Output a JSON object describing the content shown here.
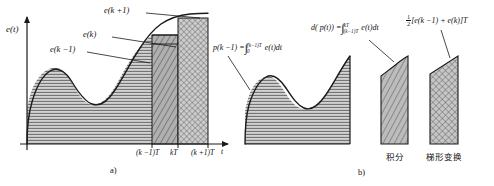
{
  "figure": {
    "caption_a": "a)",
    "caption_b": "b)"
  },
  "panel_a": {
    "y_axis_label": "e(t)",
    "x_axis_label": "t",
    "callouts": {
      "e_k_plus_1": "e(k +1)",
      "e_k": "e(k)",
      "e_k_minus_1": "e(k −1)"
    },
    "x_ticks": [
      "(k −1)T",
      "kT",
      "(k +1)T"
    ]
  },
  "panel_b": {
    "formula_p": {
      "lhs": "p(k −1) =",
      "upper_limit": "(k−1)T",
      "lower_limit": "0",
      "integrand": "e(t)dt"
    },
    "formula_dp": {
      "lhs": "d( p(t)) =",
      "upper_limit": "kT",
      "lower_limit": "(k−1)T",
      "integrand": "e(t)dt"
    },
    "formula_trap": {
      "numerator": "1",
      "denominator": "2",
      "body": "[e(k −1) + e(k)]T"
    },
    "bar_labels": {
      "integral": "积分",
      "trapezoid": "梯形变换"
    }
  },
  "colors": {
    "stroke": "#1a1a1a",
    "fill_light": "#d9d9d9",
    "fill_mid": "#c2c2c2",
    "fill_dark": "#a8a8a8",
    "hatch": "#6b6b6b",
    "background": "#ffffff"
  }
}
